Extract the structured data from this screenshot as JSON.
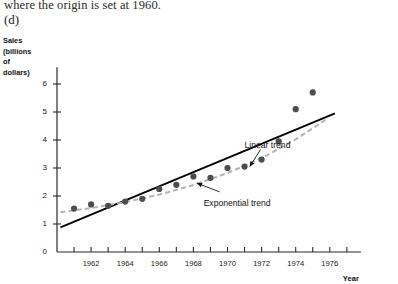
{
  "page": {
    "caption_line": "where the origin is set at 1960.",
    "part_label": "(d)"
  },
  "chart_data": {
    "type": "scatter",
    "title": "",
    "ylabel_lines": [
      "Sales",
      "(billions",
      "of",
      "dollars)"
    ],
    "xlabel": "Year",
    "xlim": [
      1960,
      1977
    ],
    "ylim": [
      0,
      6.6
    ],
    "yticks": [
      0,
      1,
      2,
      3,
      4,
      5,
      6
    ],
    "ytick_labels": [
      "0",
      "1",
      "2",
      "3",
      "4",
      "5",
      "6"
    ],
    "xticks": [
      1961,
      1962,
      1963,
      1964,
      1965,
      1966,
      1967,
      1968,
      1969,
      1970,
      1971,
      1972,
      1973,
      1974,
      1975,
      1976,
      1977
    ],
    "xtick_labels_shown": [
      "1962",
      "1964",
      "1966",
      "1968",
      "1970",
      "1972",
      "1974",
      "1976"
    ],
    "xtick_labels_shown_values": [
      1962,
      1964,
      1966,
      1968,
      1970,
      1972,
      1974,
      1976
    ],
    "grid": false,
    "legend_position": "none",
    "series": [
      {
        "name": "Sales observations",
        "type": "scatter",
        "color": "#4d4d4d",
        "x": [
          1961,
          1962,
          1963,
          1964,
          1965,
          1966,
          1967,
          1968,
          1969,
          1970,
          1971,
          1972,
          1973,
          1974,
          1975
        ],
        "values": [
          1.55,
          1.7,
          1.65,
          1.8,
          1.9,
          2.25,
          2.4,
          2.7,
          2.65,
          3.0,
          3.05,
          3.3,
          3.95,
          5.1,
          5.7
        ]
      },
      {
        "name": "Linear trend",
        "type": "line",
        "style": "solid",
        "color": "#000000",
        "x": [
          1960.2,
          1976.3
        ],
        "values": [
          0.88,
          4.95
        ]
      },
      {
        "name": "Exponential trend",
        "type": "line",
        "style": "dashed",
        "color": "#b3b3b3",
        "x": [
          1960.2,
          1962,
          1964,
          1966,
          1968,
          1970,
          1972,
          1974,
          1975.9
        ],
        "values": [
          1.42,
          1.57,
          1.78,
          2.05,
          2.39,
          2.82,
          3.35,
          4.02,
          4.78
        ]
      }
    ],
    "annotations": [
      {
        "name": "linear-trend-annotation",
        "text": "Linear trend",
        "text_x": 1971.0,
        "text_y": 3.8,
        "arrow_to_x": 1971.3,
        "arrow_to_y": 3.05
      },
      {
        "name": "exponential-trend-annotation",
        "text": "Exponential trend",
        "text_x": 1968.6,
        "text_y": 1.72,
        "arrow_to_x": 1968.2,
        "arrow_to_y": 2.46
      }
    ]
  }
}
